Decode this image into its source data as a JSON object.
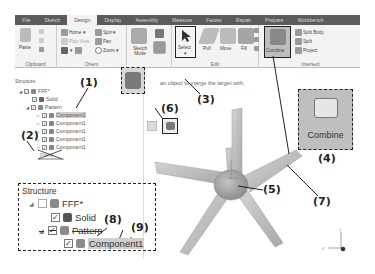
{
  "ribbon": {
    "tabs": [
      {
        "label": "File",
        "active": false
      },
      {
        "label": "Sketch",
        "active": false
      },
      {
        "label": "Design",
        "active": true
      },
      {
        "label": "Display",
        "active": false
      },
      {
        "label": "Assembly",
        "active": false
      },
      {
        "label": "Measure",
        "active": false
      },
      {
        "label": "Facets",
        "active": false
      },
      {
        "label": "Repair",
        "active": false
      },
      {
        "label": "Prepare",
        "active": false
      },
      {
        "label": "Workbench",
        "active": false
      }
    ],
    "groups": {
      "clipboard": {
        "label": "Clipboard",
        "paste": "Paste"
      },
      "orient": {
        "label": "Orient",
        "home": "Home",
        "spin": "Spin",
        "plan_view": "Plan View",
        "pan": "Pan",
        "zoom": "Zoom"
      },
      "mode": {
        "sketch_mode": "Sketch Mode"
      },
      "edit": {
        "label": "Edit",
        "select": "Select",
        "pull": "Pull",
        "move": "Move",
        "fill": "Fill"
      },
      "intersect": {
        "label": "Intersect",
        "combine": "Combine",
        "split_body": "Split Body",
        "split": "Split",
        "project": "Project"
      }
    }
  },
  "structure_panel": {
    "title": "Structure",
    "items": [
      {
        "label": "FFF*",
        "level": 0,
        "checked": true
      },
      {
        "label": "Solid",
        "level": 1,
        "checked": true
      },
      {
        "label": "Pattern",
        "level": 1,
        "checked": true
      },
      {
        "label": "Component1",
        "level": 2,
        "checked": true,
        "highlighted": true
      },
      {
        "label": "Component1",
        "level": 2,
        "checked": true
      },
      {
        "label": "Component1",
        "level": 2,
        "checked": true
      },
      {
        "label": "Component1",
        "level": 2,
        "checked": true
      },
      {
        "label": "Component1",
        "level": 2,
        "checked": true
      },
      {
        "label": "Plane",
        "level": 1,
        "crossed_out": true
      }
    ]
  },
  "viewport": {
    "hint": "Select an object to merge the target with.",
    "hint_visible": "an object to merge the target with.",
    "axis": {
      "x": "X",
      "y": "Y"
    }
  },
  "zoomed_combine": {
    "label": "Combine"
  },
  "zoomed_structure": {
    "title": "Structure",
    "items": [
      {
        "label": "FFF*"
      },
      {
        "label": "Solid"
      },
      {
        "label": "Pattern",
        "crossed_out": true
      },
      {
        "label": "Component1",
        "highlighted": true
      }
    ]
  },
  "callouts": [
    "(1)",
    "(2)",
    "(3)",
    "(4)",
    "(5)",
    "(6)",
    "(7)",
    "(8)",
    "(9)"
  ],
  "colors": {
    "tabbar": "#5b5b5b",
    "ribbon_bg": "#f3f3f3",
    "highlight": "#bfbfbf",
    "fan": "#b8b8b8"
  }
}
